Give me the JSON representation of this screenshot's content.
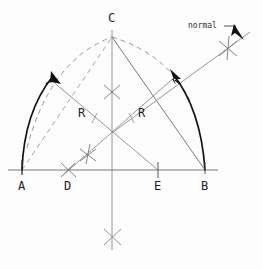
{
  "figure": {
    "type": "geometric-construction",
    "title_text": "",
    "canvas": {
      "width": 263,
      "height": 269
    },
    "background_color": "#fdfdfd",
    "stroke_color": "#555555",
    "bold_stroke_color": "#111111",
    "label_color": "#222222"
  },
  "labels": {
    "point_a": "A",
    "point_b": "B",
    "point_c": "C",
    "point_d": "D",
    "point_e": "E",
    "radius_left": "R",
    "radius_right": "R",
    "normal": "normal"
  },
  "points": {
    "A": {
      "x": 22,
      "y": 170
    },
    "B": {
      "x": 205,
      "y": 170
    },
    "C": {
      "x": 112,
      "y": 37
    },
    "D": {
      "x": 68,
      "y": 170
    },
    "E": {
      "x": 158,
      "y": 170
    },
    "center_intersection": {
      "x": 112,
      "y": 133
    }
  },
  "label_positions": {
    "A": {
      "x": 18,
      "y": 190
    },
    "B": {
      "x": 201,
      "y": 190
    },
    "C": {
      "x": 108,
      "y": 22
    },
    "D": {
      "x": 64,
      "y": 190
    },
    "E": {
      "x": 154,
      "y": 190
    },
    "R_left": {
      "x": 78,
      "y": 117
    },
    "R_right": {
      "x": 138,
      "y": 117
    },
    "normal": {
      "x": 188,
      "y": 28
    }
  },
  "geometry": {
    "baseline": {
      "x1": 8,
      "y1": 170,
      "x2": 218,
      "y2": 170
    },
    "vertical_axis": {
      "x1": 112,
      "y1": 30,
      "x2": 112,
      "y2": 250
    },
    "arc_left_solid": {
      "from": "A",
      "to": "near-C",
      "sweep": "up-right",
      "radius": 150
    },
    "arc_right_solid": {
      "from": "B",
      "to": "near-C",
      "sweep": "up-left",
      "radius": 150
    },
    "arc_left_dashed": {
      "from": "A",
      "to": "C"
    },
    "arc_right_dashed": {
      "from": "C",
      "to": "B"
    },
    "chord_AC_dashed": {
      "from": "A",
      "to": "C"
    },
    "line_CB": {
      "from": "C",
      "to": "B"
    },
    "radius_line_left": {
      "from": "E",
      "to": "arc-left"
    },
    "radius_line_right": {
      "from": "D",
      "to": "arc-right"
    },
    "normal_line": {
      "x1": 112,
      "y1": 133,
      "x2": 250,
      "y2": 32
    },
    "cross_marks": [
      {
        "x": 112,
        "y": 92,
        "label": "bisector-cross-upper"
      },
      {
        "x": 112,
        "y": 237,
        "label": "bisector-cross-lower"
      },
      {
        "x": 88,
        "y": 155,
        "label": "cross-near-d-upper"
      },
      {
        "x": 68,
        "y": 169,
        "label": "cross-at-d"
      },
      {
        "x": 228,
        "y": 48,
        "label": "cross-on-normal"
      }
    ],
    "arrowheads": [
      {
        "x": 52,
        "y": 75,
        "angle": -55,
        "target": "arc-left"
      },
      {
        "x": 172,
        "y": 72,
        "angle": -125,
        "target": "arc-right"
      },
      {
        "x": 227,
        "y": 38,
        "angle": 40,
        "target": "normal-leader"
      }
    ],
    "tick_marks": [
      {
        "x": 22,
        "y": 170,
        "label": "tick-a"
      },
      {
        "x": 158,
        "y": 170,
        "label": "tick-e"
      },
      {
        "x": 205,
        "y": 170,
        "label": "tick-b"
      }
    ],
    "leader_line": {
      "x1": 224,
      "y1": 26,
      "x2": 236,
      "y2": 26
    }
  }
}
